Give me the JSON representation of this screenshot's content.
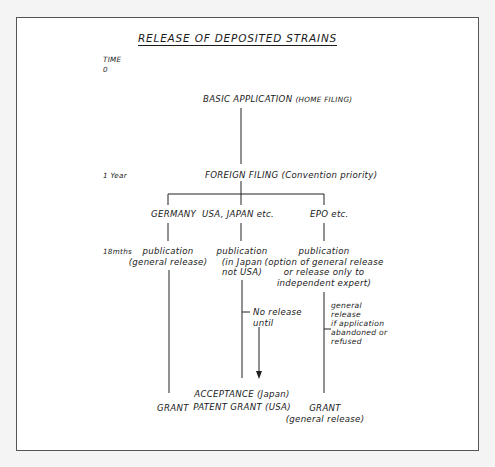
{
  "title": "RELEASE OF DEPOSITED STRAINS",
  "timeline": {
    "header": "TIME",
    "t0": "0",
    "t1": "1 Year",
    "t2": "18mths"
  },
  "nodes": {
    "basic_application": "BASIC APPLICATION",
    "basic_application_note": "(HOME FILING)",
    "foreign_filing": "FOREIGN FILING (Convention priority)",
    "branches": {
      "germany": {
        "label": "GERMANY",
        "publication": "publication",
        "publication_note": "(general release)",
        "end": "GRANT"
      },
      "usa_japan": {
        "label": "USA, JAPAN etc.",
        "publication": "publication",
        "publication_note_1": "(in Japan",
        "publication_note_2": "not USA)",
        "annotation_1": "No release",
        "annotation_2": "until",
        "end_1": "ACCEPTANCE (Japan)",
        "end_2": "PATENT GRANT (USA)"
      },
      "epo": {
        "label": "EPO etc.",
        "publication": "publication",
        "publication_note_1": "(option of general release",
        "publication_note_2": "or release only to",
        "publication_note_3": "independent expert)",
        "annotation": [
          "general",
          "release",
          "if application",
          "abandoned or",
          "refused"
        ],
        "end_1": "GRANT",
        "end_2": "(general release)"
      }
    }
  }
}
